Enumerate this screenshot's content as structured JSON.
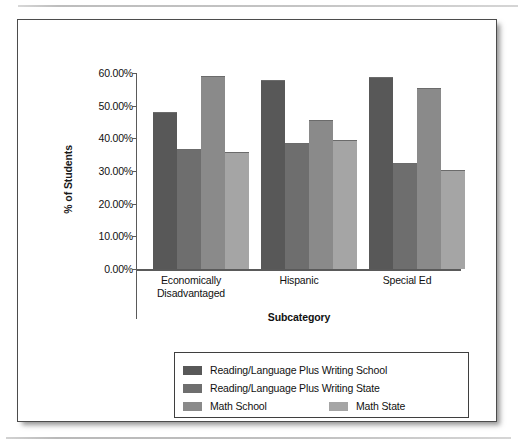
{
  "figure": {
    "frame_border_color": "#4c4c4c",
    "background": "#ffffff"
  },
  "chart_data": {
    "type": "bar",
    "title": "",
    "xlabel": "Subcategory",
    "ylabel": "% of Students",
    "categories": [
      "Economically Disadvantaged",
      "Hispanic",
      "Special Ed"
    ],
    "category_lines": [
      [
        "Economically",
        "Disadvantaged"
      ],
      [
        "Hispanic"
      ],
      [
        "Special Ed"
      ]
    ],
    "ylim": [
      0,
      60
    ],
    "ytick_values": [
      0,
      10,
      20,
      30,
      40,
      50,
      60
    ],
    "ytick_labels": [
      "0.00%",
      "10.00%",
      "20.00%",
      "30.00%",
      "40.00%",
      "50.00%",
      "60.00%"
    ],
    "grid": false,
    "legend_position": "below-axes",
    "series": [
      {
        "name": "Reading/Language Plus Writing School",
        "color": "#585858",
        "values": [
          48.0,
          57.8,
          58.8
        ]
      },
      {
        "name": "Reading/Language Plus Writing State",
        "color": "#6e6e6e",
        "values": [
          36.8,
          38.6,
          32.4
        ]
      },
      {
        "name": "Math School",
        "color": "#8a8a8a",
        "values": [
          59.0,
          45.6,
          55.4
        ]
      },
      {
        "name": "Math State",
        "color": "#a5a5a5",
        "values": [
          35.8,
          39.5,
          30.4
        ]
      }
    ]
  },
  "legend": {
    "rows": [
      [
        {
          "series_index": 0
        }
      ],
      [
        {
          "series_index": 1
        }
      ],
      [
        {
          "series_index": 2
        },
        {
          "series_index": 3
        }
      ]
    ]
  }
}
